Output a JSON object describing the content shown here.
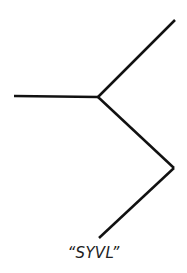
{
  "diagram": {
    "type": "skeletal-structure",
    "caption": "“SYVL”",
    "stroke_color": "#111111",
    "stroke_width": 2.5,
    "bonds": [
      {
        "id": "bond-left",
        "from": [
          14,
          96
        ],
        "to": [
          98,
          97
        ]
      },
      {
        "id": "bond-upper-right",
        "from": [
          98,
          97
        ],
        "to": [
          175,
          20
        ]
      },
      {
        "id": "bond-lower-right",
        "from": [
          98,
          97
        ],
        "to": [
          174,
          168
        ]
      },
      {
        "id": "bond-bottom",
        "from": [
          174,
          168
        ],
        "to": [
          99,
          238
        ]
      }
    ]
  }
}
